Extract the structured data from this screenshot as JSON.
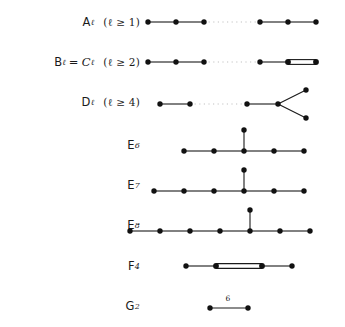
{
  "figure": {
    "background_color": "#ffffff",
    "ink_color": "#1a1a1a",
    "dot_color": "#111111",
    "dotted_color": "#b9b9b9"
  },
  "rows": [
    {
      "id": "A",
      "name": "A",
      "subscript": "ℓ",
      "condition": "(ℓ ≥ 1)",
      "label_text": "Aℓ   (ℓ ≥ 1)",
      "equals": "",
      "edge_label": "",
      "graph": {
        "type": "chain-with-ellipsis",
        "nodes_left": 3,
        "nodes_right": 3,
        "double_bond": false,
        "fork": false,
        "branch_node": false
      }
    },
    {
      "id": "BC",
      "name": "B",
      "subscript": "ℓ",
      "equals": "= Cℓ",
      "condition": "(ℓ ≥ 2)",
      "label_text": "Bℓ = Cℓ   (ℓ ≥ 2)",
      "edge_label": "",
      "graph": {
        "type": "chain-with-ellipsis",
        "nodes_left": 3,
        "nodes_right": 3,
        "double_bond": true,
        "fork": false,
        "branch_node": false
      }
    },
    {
      "id": "D",
      "name": "D",
      "subscript": "ℓ",
      "equals": "",
      "condition": "(ℓ ≥ 4)",
      "label_text": "Dℓ   (ℓ ≥ 4)",
      "edge_label": "",
      "graph": {
        "type": "chain-with-ellipsis-fork",
        "nodes_left": 2,
        "nodes_right": 2,
        "double_bond": false,
        "fork": true,
        "branch_node": false
      }
    },
    {
      "id": "E6",
      "name": "E",
      "subscript": "6",
      "equals": "",
      "condition": "",
      "label_text": "E6",
      "edge_label": "",
      "graph": {
        "type": "chain-with-branch",
        "chain_nodes": 5,
        "branch_index": 2,
        "double_bond": false,
        "fork": false,
        "branch_node": true
      }
    },
    {
      "id": "E7",
      "name": "E",
      "subscript": "7",
      "equals": "",
      "condition": "",
      "label_text": "E7",
      "edge_label": "",
      "graph": {
        "type": "chain-with-branch",
        "chain_nodes": 6,
        "branch_index": 3,
        "double_bond": false,
        "fork": false,
        "branch_node": true
      }
    },
    {
      "id": "E8",
      "name": "E",
      "subscript": "8",
      "equals": "",
      "condition": "",
      "label_text": "E8",
      "edge_label": "",
      "graph": {
        "type": "chain-with-branch",
        "chain_nodes": 7,
        "branch_index": 4,
        "double_bond": false,
        "fork": false,
        "branch_node": true
      }
    },
    {
      "id": "F4",
      "name": "F",
      "subscript": "4",
      "equals": "",
      "condition": "",
      "label_text": "F4",
      "edge_label": "",
      "graph": {
        "type": "chain-double-middle",
        "chain_nodes": 4,
        "double_bond": true,
        "double_bond_index": 1,
        "fork": false,
        "branch_node": false
      }
    },
    {
      "id": "G2",
      "name": "G",
      "subscript": "2",
      "equals": "",
      "condition": "",
      "label_text": "G2",
      "edge_label": "6",
      "graph": {
        "type": "chain-labeled",
        "chain_nodes": 2,
        "double_bond": false,
        "fork": false,
        "branch_node": false
      }
    }
  ]
}
